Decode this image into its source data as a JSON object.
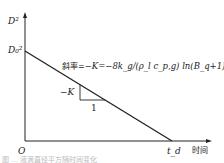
{
  "diagram": {
    "y_axis_label": "D²",
    "y_intercept_label": "D₀²",
    "origin_label": "O",
    "x_end_label": "t_d",
    "x_axis_label": "时间",
    "slope_prefix": "斜率=",
    "slope_formula": "−K=−8k_g/(ρ_l c_p,g) ln(B_q+1)",
    "triangle_rise_label": "−K",
    "triangle_run_label": "1",
    "caption": "图 … 液滴直径平方随时间变化"
  },
  "colors": {
    "line": "#222222",
    "background": "#ffffff"
  }
}
